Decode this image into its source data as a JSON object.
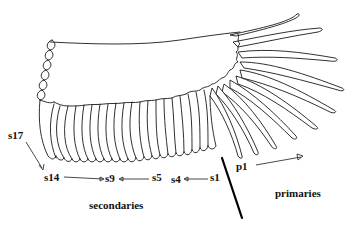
{
  "figure": {
    "labels": {
      "s17": "s17",
      "s14": "s14",
      "s9": "s9",
      "s5": "s5",
      "s4": "s4",
      "s1": "s1",
      "p1": "p1",
      "secondaries": "secondaries",
      "primaries": "primaries"
    },
    "arrows": [
      {
        "from": "s17",
        "to": "s14",
        "direction": "down"
      },
      {
        "from": "s14",
        "to": "s9",
        "direction": "right"
      },
      {
        "from": "s5",
        "to": "s9",
        "direction": "left"
      },
      {
        "from": "s1",
        "to": "s4",
        "direction": "left"
      },
      {
        "from": "p1",
        "to": "outer-primaries",
        "direction": "right"
      }
    ],
    "divider": "Thick line separating secondaries from primaries",
    "colors": {
      "ink": "#1a1a1a",
      "background": "#ffffff"
    }
  }
}
